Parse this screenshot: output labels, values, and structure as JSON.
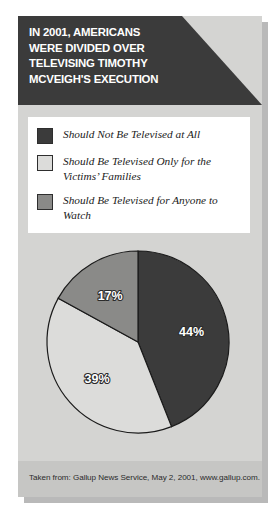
{
  "title": {
    "lines": [
      "IN 2001, AMERICANS",
      "WERE DIVIDED OVER",
      "TELEVISING TIMOTHY",
      "MCVEIGH'S EXECUTION"
    ]
  },
  "legend": {
    "items": [
      {
        "label": "Should Not Be Televised at All",
        "color": "#3b3b3b"
      },
      {
        "label": "Should Be Televised Only for the Victims’ Families",
        "color": "#dcdcda"
      },
      {
        "label": "Should Be Televised for Anyone to Watch",
        "color": "#8a8a88"
      }
    ]
  },
  "chart_data": {
    "type": "pie",
    "title": "In 2001, Americans Were Divided Over Televising Timothy McVeigh's Execution",
    "categories": [
      "Should Not Be Televised at All",
      "Should Be Televised Only for the Victims’ Families",
      "Should Be Televised for Anyone to Watch"
    ],
    "values": [
      44,
      39,
      17
    ],
    "labels": [
      "44%",
      "39%",
      "17%"
    ],
    "unit": "percent",
    "colors": [
      "#3b3b3b",
      "#dcdcda",
      "#8a8a88"
    ],
    "start_angle_deg": 0,
    "direction": "clockwise",
    "legend_position": "top",
    "grid": false
  },
  "footer": {
    "source": "Taken from: Gallup News Service, May 2, 2001, www.gallup.com."
  }
}
